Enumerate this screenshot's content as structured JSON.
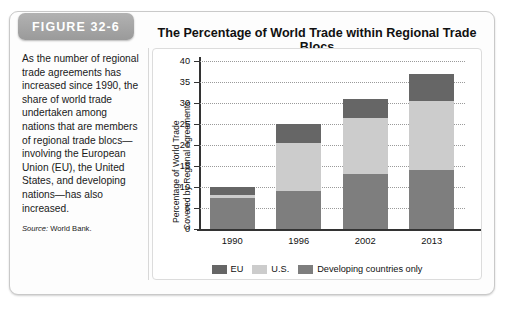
{
  "figure": {
    "tab_label": "FIGURE 32-6",
    "caption": "As the number of regional trade agreements has increased since 1990, the share of world trade undertaken among nations that are members of regional trade blocs—involving the European Union (EU), the United States, and developing nations—has also increased.",
    "source_prefix": "Source:",
    "source_text": "World Bank."
  },
  "chart_data": {
    "type": "bar",
    "subtype": "stacked-bar",
    "title": "The Percentage of World Trade within Regional Trade Blocs",
    "xlabel": "",
    "ylabel": "Percentage of World Trade Covered by Regional Agreements",
    "ylabel_line1": "Percentage of World Trade",
    "ylabel_line2": "Covered by Regional Agreements",
    "categories": [
      "1990",
      "1996",
      "2002",
      "2013"
    ],
    "ylim": [
      0,
      40
    ],
    "yticks": [
      0,
      5,
      10,
      15,
      20,
      25,
      30,
      35,
      40
    ],
    "ytick_labels": [
      "0",
      "5",
      "10",
      "15",
      "20",
      "25",
      "30",
      "35",
      "40"
    ],
    "grid": true,
    "legend_position": "bottom",
    "stack_order": [
      "Developing countries only",
      "U.S.",
      "EU"
    ],
    "series": [
      {
        "name": "Developing countries only",
        "color": "#7e7e7e",
        "values": [
          7.5,
          9.0,
          13.0,
          14.0
        ]
      },
      {
        "name": "U.S.",
        "color": "#cccccc",
        "values": [
          0.5,
          11.5,
          13.5,
          16.5
        ]
      },
      {
        "name": "EU",
        "color": "#666666",
        "values": [
          2.0,
          4.5,
          4.5,
          6.5
        ]
      }
    ],
    "totals": [
      10.0,
      25.0,
      31.0,
      37.0
    ],
    "legend": [
      {
        "label": "EU",
        "color": "#666666"
      },
      {
        "label": "U.S.",
        "color": "#cccccc"
      },
      {
        "label": "Developing countries only",
        "color": "#7e7e7e"
      }
    ]
  }
}
